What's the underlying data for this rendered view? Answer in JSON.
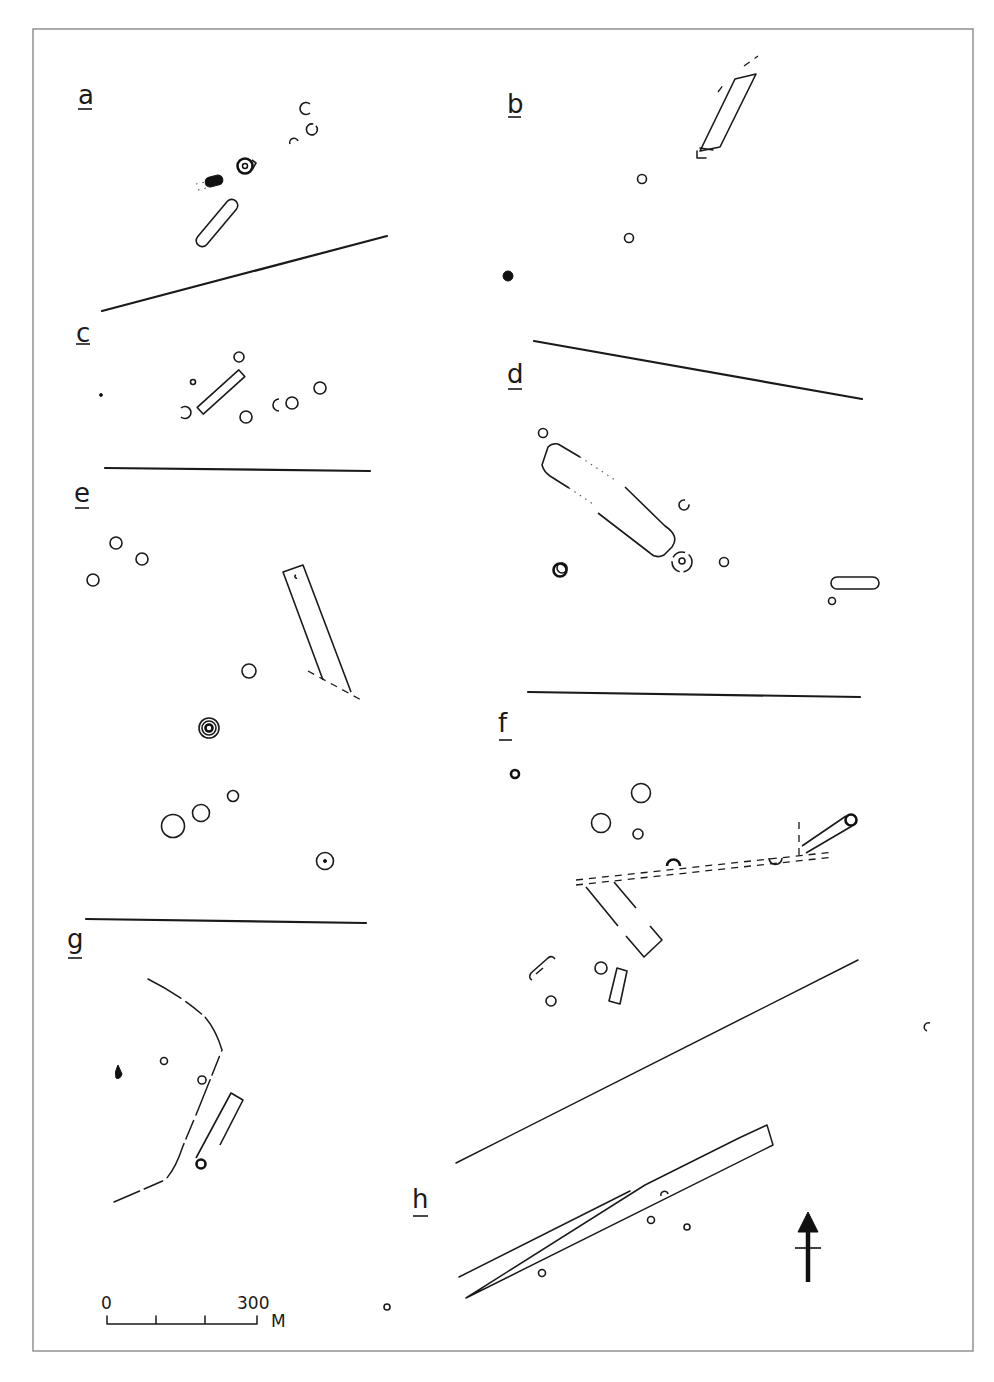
{
  "figure": {
    "panels": [
      {
        "id": "a",
        "label": "a"
      },
      {
        "id": "b",
        "label": "b"
      },
      {
        "id": "c",
        "label": "c"
      },
      {
        "id": "d",
        "label": "d"
      },
      {
        "id": "e",
        "label": "e"
      },
      {
        "id": "f",
        "label": "f"
      },
      {
        "id": "g",
        "label": "g"
      },
      {
        "id": "h",
        "label": "h"
      }
    ],
    "scale_bar": {
      "start_label": "0",
      "end_label": "300",
      "unit_label": "M",
      "divisions": 3
    },
    "north_arrow": {
      "icon": "north-arrow-icon"
    },
    "colors": {
      "ink": "#1a1a1a",
      "frame": "#8a8a8a",
      "background": "#ffffff"
    }
  }
}
